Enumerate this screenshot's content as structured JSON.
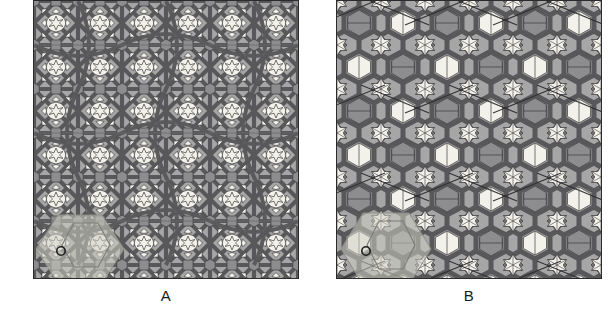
{
  "figure": {
    "type": "geometric-tiling-comparison",
    "background_color": "#ffffff",
    "panel_count": 2
  },
  "panels": [
    {
      "id": "A",
      "label": "A",
      "border_color": "#2b2b2b",
      "background_color": "#a6a6a6",
      "strap_color": "#58585a",
      "tile_light_color": "#f2f1ea",
      "tile_mid_color": "#8d8d8f",
      "tile_dark_color": "#77777a",
      "overlay_color": "#cfcfc4",
      "marker": "circle",
      "marker_position": "lower-left",
      "motifs": [
        "decagon",
        "hexagon",
        "square",
        "six-pointed-star",
        "kite",
        "dart"
      ],
      "width_px": 266,
      "height_px": 279
    },
    {
      "id": "B",
      "label": "B",
      "border_color": "#2b2b2b",
      "background_color": "#a6a6a6",
      "strap_color": "#58585a",
      "tile_light_color": "#f2f1ea",
      "tile_mid_color": "#8d8d8f",
      "tile_dark_color": "#77777a",
      "overlay_color": "#cfcfc4",
      "marker": "circle",
      "marker_position": "lower-left",
      "motifs": [
        "hexagon",
        "six-pointed-star",
        "rhombus",
        "triangle",
        "diagonal-line"
      ],
      "width_px": 266,
      "height_px": 279
    }
  ],
  "colors": {
    "page_background": "#ffffff",
    "frame_stroke": "#2b2b2b",
    "strapwork": "#58585a",
    "strapwork_edge": "#3a3a3c",
    "tile_light": "#f2f1ea",
    "tile_mid": "#8d8d8f",
    "tile_dark": "#77777a",
    "field": "#a6a6a6",
    "overlay_highlight": "#cfcfc4",
    "label_text": "#1a1a1a"
  }
}
